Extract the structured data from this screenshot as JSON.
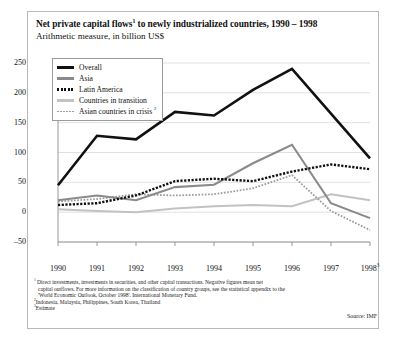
{
  "title": {
    "text_before": "Net private capital flows",
    "marker": "1",
    "text_after": " to newly industrialized countries, 1990 – 1998"
  },
  "subtitle": "Arithmetic measure, in billion US$",
  "footnotes": {
    "line1": "Direct investments, investments in securities, and other capital transactions. Negative figures mean net",
    "line2": "capital outflows. For more information on the classification of country groups, see the statistical appendix to the",
    "line3": "'World Economic Outlook, October 1998'. International Monetary Fund.",
    "marker1": "1",
    "marker2": "2",
    "note2": "Indonesia, Malaysia, Philippines, South Korea, Thailand",
    "marker3": "3",
    "note3": "Estimate"
  },
  "source": "Source: IMF",
  "colors": {
    "overall": "#111111",
    "asia": "#8a8a8a",
    "latin_america": "#111111",
    "countries_in_transition": "#c2c2c2",
    "asian_countries_in_crisis": "#9d9d9d",
    "grid": "#d8d8d8",
    "axis": "#8c8c8c",
    "frame": "#b9b9b9"
  },
  "chart_data": {
    "type": "line",
    "subtitle": "Arithmetic measure, in billion US$",
    "xlabel": "",
    "ylabel": "billion US$",
    "x": [
      1990,
      1991,
      1992,
      1993,
      1994,
      1995,
      1996,
      1997,
      1998
    ],
    "x_tick_labels": [
      "1990",
      "1991",
      "1992",
      "1993",
      "1994",
      "1995",
      "1996",
      "1997",
      "1998"
    ],
    "x_last_marker": "3",
    "y_tick_labels": [
      "250",
      "200",
      "150",
      "100",
      "50",
      "0",
      "-50"
    ],
    "y_ticks": [
      250,
      200,
      150,
      100,
      50,
      0,
      -50
    ],
    "ylim": [
      -50,
      250
    ],
    "xlim": [
      1990,
      1998
    ],
    "grid": true,
    "legend_position": "top-left",
    "series": [
      {
        "name": "Overall",
        "style": "solid-thick",
        "color": "#111111",
        "values": [
          45,
          128,
          122,
          168,
          162,
          205,
          240,
          165,
          90
        ]
      },
      {
        "name": "Asia",
        "style": "solid",
        "color": "#8a8a8a",
        "values": [
          20,
          28,
          20,
          42,
          46,
          82,
          113,
          15,
          -10
        ]
      },
      {
        "name": "Latin America",
        "style": "dotted-thick",
        "color": "#111111",
        "values": [
          12,
          15,
          28,
          52,
          56,
          52,
          68,
          80,
          72
        ]
      },
      {
        "name": "Countries in transition",
        "style": "solid-light",
        "color": "#c2c2c2",
        "values": [
          5,
          2,
          0,
          6,
          10,
          12,
          10,
          30,
          20
        ]
      },
      {
        "name": "Asian countries in crisis",
        "marker": "2",
        "style": "dotted",
        "color": "#9d9d9d",
        "values": [
          18,
          22,
          30,
          28,
          30,
          40,
          62,
          2,
          -30
        ]
      }
    ]
  },
  "legend": {
    "items": [
      {
        "label": "Overall"
      },
      {
        "label": "Asia"
      },
      {
        "label": "Latin America"
      },
      {
        "label": "Countries in transition"
      },
      {
        "label": "Asian countries in crisis",
        "marker": "2"
      }
    ]
  }
}
